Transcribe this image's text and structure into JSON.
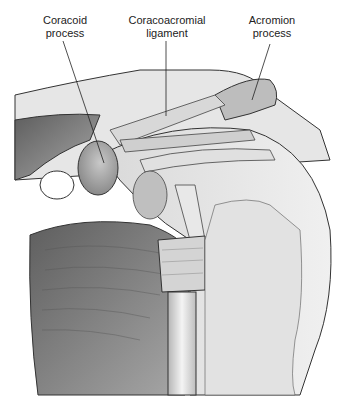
{
  "figure": {
    "labels": [
      {
        "id": "coracoid",
        "line1": "Coracoid",
        "line2": "process"
      },
      {
        "id": "coracoacromial",
        "line1": "Coracoacromial",
        "line2": "ligament"
      },
      {
        "id": "acromion",
        "line1": "Acromion",
        "line2": "process"
      }
    ],
    "colors": {
      "background": "#ffffff",
      "bone_light": "#e4e4e4",
      "muscle_dark": "#6e6e6e",
      "muscle_mid": "#9a9a9a",
      "ligament": "#cfcfcf",
      "outline": "#333333",
      "leader_line": "#222222"
    }
  }
}
